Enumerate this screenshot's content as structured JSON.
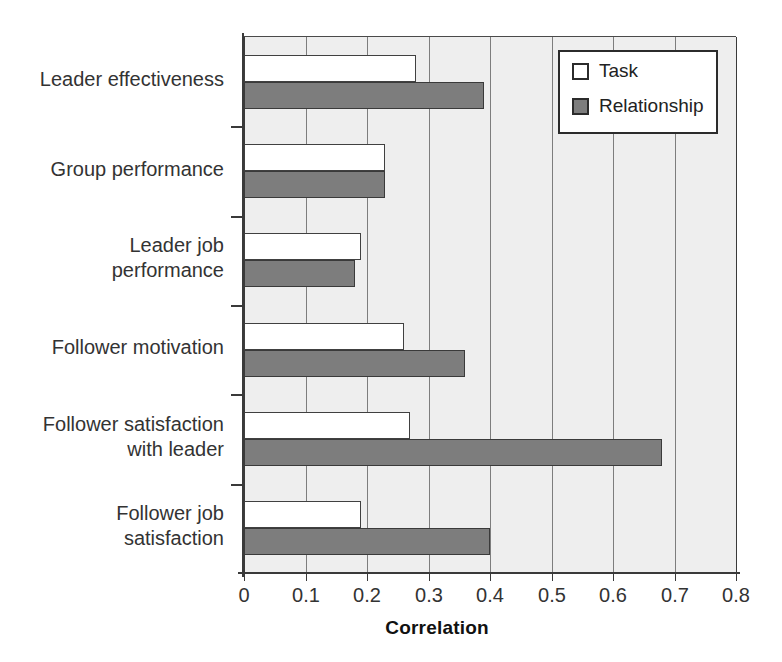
{
  "chart_data": {
    "type": "bar",
    "orientation": "horizontal",
    "title": "",
    "xlabel": "Correlation",
    "ylabel": "",
    "xlim": [
      0,
      0.8
    ],
    "xticks": [
      "0",
      "0.1",
      "0.2",
      "0.3",
      "0.4",
      "0.5",
      "0.6",
      "0.7",
      "0.8"
    ],
    "xtick_values": [
      0,
      0.1,
      0.2,
      0.3,
      0.4,
      0.5,
      0.6,
      0.7,
      0.8
    ],
    "grid": "vertical",
    "legend_position": "top-right",
    "categories": [
      "Leader effectiveness",
      "Group performance",
      "Leader job\nperformance",
      "Follower motivation",
      "Follower satisfaction\nwith leader",
      "Follower job\nsatisfaction"
    ],
    "series": [
      {
        "name": "Task",
        "color": "#ffffff",
        "values": [
          0.28,
          0.23,
          0.19,
          0.26,
          0.27,
          0.19
        ]
      },
      {
        "name": "Relationship",
        "color": "#7d7d7d",
        "values": [
          0.39,
          0.23,
          0.18,
          0.36,
          0.68,
          0.4
        ]
      }
    ]
  },
  "legend": {
    "items": [
      {
        "label": "Task",
        "swatch": "task"
      },
      {
        "label": "Relationship",
        "swatch": "rel"
      }
    ]
  },
  "colors": {
    "plot_background": "#eeeeee",
    "axis": "#3a3a3a",
    "gridline": "#7d7d7d",
    "task_fill": "#ffffff",
    "relationship_fill": "#7d7d7d",
    "text": "#333333"
  }
}
